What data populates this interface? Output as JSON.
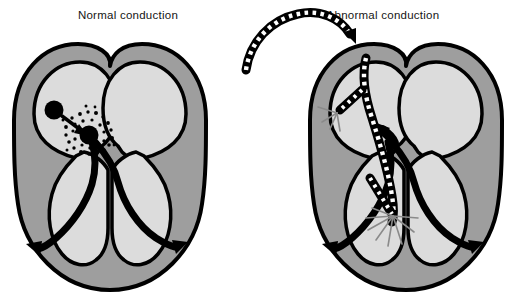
{
  "figure": {
    "panels": [
      {
        "id": "normal",
        "title": "Normal conduction",
        "description": "Heart cross-section showing normal electrical conduction from sinoatrial node to atrioventricular node, down the bundle of His and out along the Purkinje fibers of both ventricles."
      },
      {
        "id": "abnormal",
        "title": "Abnormal conduction",
        "description": "Heart cross-section with an ablation catheter threaded in from outside, tips delivering energy at two sites with radiating spark marks."
      }
    ]
  },
  "colors": {
    "background": "#ffffff",
    "outline": "#000000",
    "myocardium": "#9e9e9e",
    "chamber": "#dcdcdc",
    "conduction": "#000000",
    "catheter_body": "#000000",
    "catheter_marking": "#ffffff",
    "spark": "#8a8a8a",
    "title_text": "#151515"
  },
  "labels": {
    "sa_node": "sinoatrial node",
    "av_node": "atrioventricular node",
    "bundle_of_his": "bundle of His",
    "purkinje_left": "left Purkinje fibers",
    "purkinje_right": "right Purkinje fibers",
    "catheter": "ablation catheter",
    "ablation_upper": "upper ablation site",
    "ablation_lower": "lower ablation site"
  }
}
